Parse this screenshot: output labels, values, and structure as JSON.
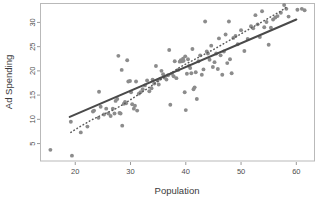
{
  "chart_data": {
    "type": "scatter",
    "title": "",
    "xlabel": "Population",
    "ylabel": "Ad Spending",
    "xlim": [
      13.8,
      63.2
    ],
    "ylim": [
      1.4,
      33.8
    ],
    "xticks": [
      20,
      30,
      40,
      50,
      60
    ],
    "yticks": [
      5,
      10,
      15,
      20,
      25,
      30
    ],
    "grid": false,
    "legend": null,
    "point_color": "#8c8c8c",
    "line_color": "#4a4a4a",
    "points": [
      [
        15.5,
        3.7
      ],
      [
        19.4,
        2.5
      ],
      [
        19.2,
        9.5
      ],
      [
        21.0,
        7.3
      ],
      [
        22.2,
        8.5
      ],
      [
        23.2,
        11.6
      ],
      [
        23.4,
        11.8
      ],
      [
        24.2,
        10.3
      ],
      [
        24.3,
        15.7
      ],
      [
        24.6,
        12.6
      ],
      [
        25.2,
        11.0
      ],
      [
        25.6,
        12.2
      ],
      [
        26.0,
        11.2
      ],
      [
        26.4,
        10.7
      ],
      [
        26.8,
        12.2
      ],
      [
        27.1,
        11.2
      ],
      [
        27.3,
        13.8
      ],
      [
        27.6,
        14.2
      ],
      [
        27.8,
        23.1
      ],
      [
        28.0,
        11.3
      ],
      [
        28.2,
        11.2
      ],
      [
        28.4,
        20.2
      ],
      [
        28.5,
        8.7
      ],
      [
        28.8,
        13.2
      ],
      [
        29.0,
        13.6
      ],
      [
        29.2,
        13.3
      ],
      [
        29.4,
        22.2
      ],
      [
        29.6,
        17.8
      ],
      [
        29.9,
        17.9
      ],
      [
        30.1,
        15.6
      ],
      [
        30.3,
        13.1
      ],
      [
        30.6,
        12.2
      ],
      [
        30.8,
        12.8
      ],
      [
        31.0,
        17.8
      ],
      [
        31.2,
        11.8
      ],
      [
        31.5,
        15.3
      ],
      [
        31.8,
        15.6
      ],
      [
        32.2,
        16.2
      ],
      [
        32.6,
        17.0
      ],
      [
        33.0,
        18.0
      ],
      [
        33.4,
        15.8
      ],
      [
        33.8,
        16.4
      ],
      [
        34.0,
        18.2
      ],
      [
        34.3,
        17.4
      ],
      [
        34.6,
        21.0
      ],
      [
        34.9,
        18.0
      ],
      [
        35.1,
        17.2
      ],
      [
        35.4,
        18.4
      ],
      [
        35.6,
        20.0
      ],
      [
        35.9,
        19.3
      ],
      [
        36.2,
        18.6
      ],
      [
        36.5,
        18.2
      ],
      [
        36.8,
        19.1
      ],
      [
        37.0,
        24.3
      ],
      [
        37.2,
        13.0
      ],
      [
        37.5,
        19.4
      ],
      [
        37.8,
        18.9
      ],
      [
        38.0,
        22.0
      ],
      [
        38.3,
        18.5
      ],
      [
        38.6,
        20.2
      ],
      [
        38.9,
        21.9
      ],
      [
        39.1,
        22.2
      ],
      [
        39.3,
        22.0
      ],
      [
        39.5,
        22.5
      ],
      [
        39.6,
        22.1
      ],
      [
        39.8,
        15.6
      ],
      [
        39.9,
        23.0
      ],
      [
        40.0,
        11.9
      ],
      [
        40.2,
        19.4
      ],
      [
        40.4,
        22.4
      ],
      [
        40.6,
        21.0
      ],
      [
        40.8,
        20.6
      ],
      [
        41.0,
        19.5
      ],
      [
        41.2,
        24.5
      ],
      [
        41.4,
        16.2
      ],
      [
        41.6,
        16.6
      ],
      [
        41.8,
        19.7
      ],
      [
        42.0,
        14.2
      ],
      [
        42.3,
        22.0
      ],
      [
        42.6,
        23.2
      ],
      [
        42.9,
        19.2
      ],
      [
        43.2,
        20.3
      ],
      [
        43.5,
        30.2
      ],
      [
        43.8,
        24.0
      ],
      [
        44.0,
        23.6
      ],
      [
        44.3,
        22.3
      ],
      [
        44.6,
        25.2
      ],
      [
        44.9,
        20.8
      ],
      [
        45.2,
        21.8
      ],
      [
        45.5,
        23.6
      ],
      [
        45.8,
        20.4
      ],
      [
        46.0,
        26.7
      ],
      [
        46.3,
        23.2
      ],
      [
        46.6,
        19.2
      ],
      [
        46.9,
        24.0
      ],
      [
        47.2,
        27.5
      ],
      [
        47.5,
        21.6
      ],
      [
        47.8,
        30.2
      ],
      [
        48.0,
        22.4
      ],
      [
        48.3,
        19.5
      ],
      [
        48.6,
        26.8
      ],
      [
        49.0,
        27.2
      ],
      [
        49.4,
        25.5
      ],
      [
        50.0,
        28.4
      ],
      [
        50.6,
        24.1
      ],
      [
        51.2,
        26.6
      ],
      [
        51.8,
        29.2
      ],
      [
        52.2,
        28.8
      ],
      [
        52.6,
        31.5
      ],
      [
        53.0,
        29.6
      ],
      [
        53.4,
        27.0
      ],
      [
        53.8,
        32.3
      ],
      [
        54.2,
        29.0
      ],
      [
        54.6,
        30.1
      ],
      [
        55.0,
        25.4
      ],
      [
        55.4,
        28.9
      ],
      [
        55.8,
        30.6
      ],
      [
        56.2,
        31.0
      ],
      [
        56.6,
        31.3
      ],
      [
        57.2,
        32.0
      ],
      [
        57.8,
        33.6
      ],
      [
        58.2,
        32.8
      ],
      [
        58.6,
        31.2
      ],
      [
        60.2,
        32.6
      ],
      [
        61.0,
        32.8
      ],
      [
        61.5,
        32.5
      ]
    ],
    "fit_line": {
      "name": "regression-line",
      "style": "solid",
      "points": [
        [
          19.0,
          10.5
        ],
        [
          60.0,
          30.6
        ]
      ]
    },
    "reference_line": {
      "name": "reference-curve",
      "style": "dotted",
      "points": [
        [
          19.2,
          7.3
        ],
        [
          21.0,
          8.6
        ],
        [
          23.0,
          9.9
        ],
        [
          25.0,
          11.0
        ],
        [
          27.0,
          12.0
        ],
        [
          29.0,
          13.3
        ],
        [
          31.0,
          14.8
        ],
        [
          33.0,
          16.3
        ],
        [
          35.0,
          17.9
        ],
        [
          37.0,
          19.3
        ],
        [
          39.0,
          20.8
        ],
        [
          41.0,
          22.0
        ],
        [
          43.0,
          23.2
        ],
        [
          45.0,
          24.4
        ],
        [
          47.0,
          25.7
        ],
        [
          49.0,
          27.0
        ],
        [
          51.0,
          28.3
        ],
        [
          53.0,
          29.6
        ],
        [
          55.0,
          30.9
        ],
        [
          57.0,
          32.2
        ],
        [
          58.4,
          33.3
        ]
      ]
    }
  },
  "axes": {
    "x_title": "Population",
    "y_title": "Ad Spending",
    "x_tick_labels": [
      "20",
      "30",
      "40",
      "50",
      "60"
    ],
    "y_tick_labels": [
      "5",
      "10",
      "15",
      "20",
      "25",
      "30"
    ]
  }
}
